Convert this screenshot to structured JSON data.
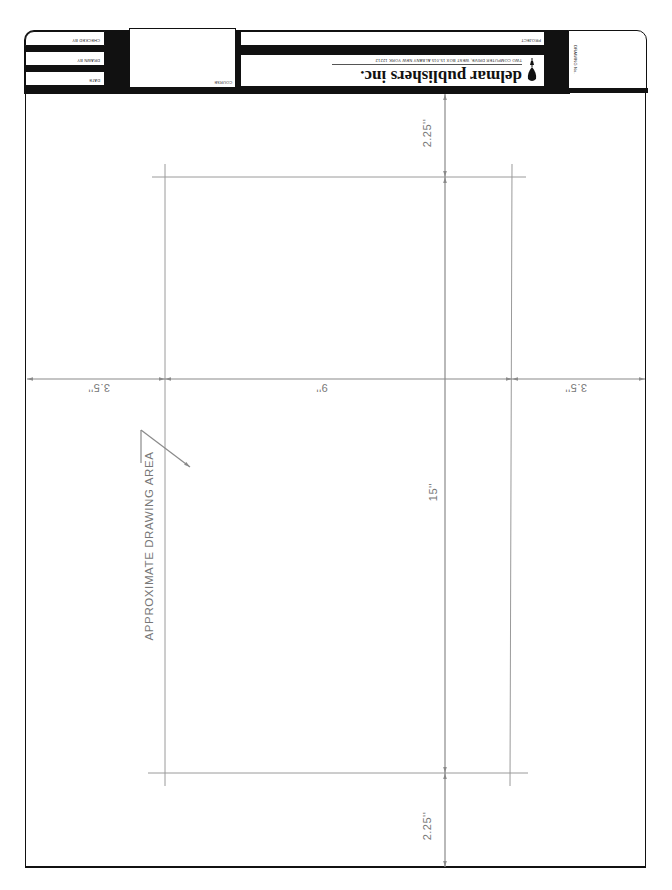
{
  "title_block": {
    "orientation": "upside-down",
    "fields": {
      "checked_by": "CHECKED BY",
      "drawn_by": "DRAWN BY",
      "date": "DATE",
      "course": "COURSE",
      "project": "PROJECT",
      "drawing_no": "DRAWING No."
    },
    "company": {
      "name": "delmar publishers inc.",
      "address": "TWO COMPUTER DRIVE, WEST BOX 15-015 ALBANY NEW YORK 12212",
      "logo": "pen-nib-icon"
    }
  },
  "dimensions": {
    "left_margin": "3.5''",
    "drawing_width": "9''",
    "right_margin": "3.5''",
    "top_margin": "2.25''",
    "drawing_height": "15''",
    "bottom_margin": "2.25''"
  },
  "annotation": {
    "drawing_area_label": "APPROXIMATE DRAWING AREA"
  },
  "colors": {
    "border": "#111111",
    "dimension_lines": "#8a8a8a",
    "construction_lines": "#9a9a9a",
    "paper": "#ffffff"
  }
}
